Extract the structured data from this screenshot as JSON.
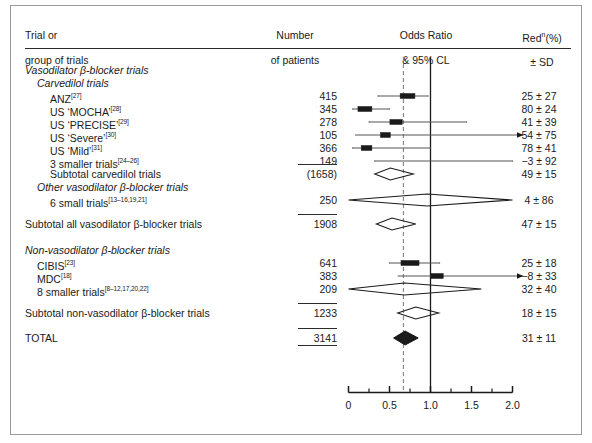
{
  "header": {
    "col_trial_line1": "Trial or",
    "col_trial_line2": "group of trials",
    "col_number_line1": "Number",
    "col_number_line2": "of patients",
    "col_or_line1": "Odds Ratio",
    "col_or_line2": "& 95% CL",
    "col_red_line1": "Red",
    "col_red_sup": "n",
    "col_red_line1b": "(%)",
    "col_red_line2": "± SD"
  },
  "chart_data": {
    "type": "forest",
    "title": "Odds Ratio & 95% CL",
    "xlabel": "",
    "xlim": [
      0,
      2.0
    ],
    "xticks": [
      0,
      0.5,
      1.0,
      1.5,
      2.0
    ],
    "xticklabels": [
      "0",
      "0.5",
      "1.0",
      "1.5",
      "2.0"
    ],
    "minor_ticks": [
      0.25,
      0.75,
      1.25,
      1.75
    ],
    "reference_line": 1.0,
    "pooled_line": 0.67,
    "grid": false,
    "rows": [
      {
        "kind": "section",
        "indent": 0,
        "italic": true,
        "label": "Vasodilator β-blocker trials",
        "n": "",
        "red": ""
      },
      {
        "kind": "section",
        "indent": 1,
        "italic": true,
        "label": "Carvedilol trials",
        "n": "",
        "red": ""
      },
      {
        "kind": "trial",
        "indent": 2,
        "italic": false,
        "label": "ANZ",
        "ref": "[27]",
        "n": "415",
        "red": "25 ± 27",
        "or": 0.72,
        "ci_low": 0.36,
        "ci_high": 0.97,
        "box": 0.09,
        "arrow": false
      },
      {
        "kind": "trial",
        "indent": 2,
        "italic": false,
        "label": "US ‘MOCHA’",
        "ref": "[28]",
        "n": "345",
        "red": "80 ± 24",
        "or": 0.2,
        "ci_low": 0.05,
        "ci_high": 0.5,
        "box": 0.085,
        "arrow": false
      },
      {
        "kind": "trial",
        "indent": 2,
        "italic": false,
        "label": "US ‘PRECISE’",
        "ref": "[29]",
        "n": "278",
        "red": "41 ± 39",
        "or": 0.58,
        "ci_low": 0.25,
        "ci_high": 1.44,
        "box": 0.075,
        "arrow": false
      },
      {
        "kind": "trial",
        "indent": 2,
        "italic": false,
        "label": "US ‘Severe’",
        "ref": "[30]",
        "n": "105",
        "red": "54 ± 75",
        "or": 0.45,
        "ci_low": 0.08,
        "ci_high": 2.0,
        "box": 0.06,
        "arrow": true
      },
      {
        "kind": "trial",
        "indent": 2,
        "italic": false,
        "label": "US ‘Mild’",
        "ref": "[31]",
        "n": "366",
        "red": "78 ± 41",
        "or": 0.22,
        "ci_low": 0.05,
        "ci_high": 1.0,
        "box": 0.065,
        "arrow": false
      },
      {
        "kind": "trial",
        "indent": 2,
        "italic": false,
        "label": "3 smaller trials",
        "ref": "[24–26]",
        "n": "149",
        "red": "−3 ± 92",
        "or": 1.03,
        "ci_low": 0.32,
        "ci_high": 2.0,
        "box": 0.0,
        "arrow": false,
        "flat": true
      },
      {
        "kind": "subtotal",
        "indent": 2,
        "italic": false,
        "label": "Subtotal carvedilol trials",
        "n": "(1658)",
        "red": "49 ± 15",
        "or": 0.51,
        "ci_low": 0.32,
        "ci_high": 0.79,
        "diamond": true,
        "filled": false
      },
      {
        "kind": "section",
        "indent": 1,
        "italic": true,
        "label": "Other vasodilator β-blocker trials",
        "n": "",
        "red": ""
      },
      {
        "kind": "trial",
        "indent": 2,
        "italic": false,
        "label": "6 small trials",
        "ref": "[13–16,19,21]",
        "n": "250",
        "red": "4 ± 86",
        "or": 0.96,
        "ci_low": 0.0,
        "ci_high": 2.0,
        "diamond": true,
        "filled": false
      },
      {
        "kind": "subtotal-major",
        "indent": 0,
        "italic": false,
        "label": "Subtotal all vasodilator β-blocker trials",
        "n": "1908",
        "rule": true,
        "red": "47 ± 15",
        "or": 0.53,
        "ci_low": 0.34,
        "ci_high": 0.82,
        "diamond": true,
        "filled": false
      },
      {
        "kind": "section",
        "indent": 0,
        "italic": true,
        "label": "Non-vasodilator β-blocker trials",
        "n": "",
        "red": ""
      },
      {
        "kind": "trial",
        "indent": 1,
        "italic": false,
        "label": "CIBIS",
        "ref": "[23]",
        "n": "641",
        "red": "25 ± 18",
        "or": 0.75,
        "ci_low": 0.5,
        "ci_high": 1.11,
        "box": 0.11,
        "arrow": false
      },
      {
        "kind": "trial",
        "indent": 1,
        "italic": false,
        "label": "MDC",
        "ref": "[18]",
        "n": "383",
        "red": "−8 ± 33",
        "or": 1.08,
        "ci_low": 0.6,
        "ci_high": 2.0,
        "box": 0.075,
        "arrow": true
      },
      {
        "kind": "trial",
        "indent": 1,
        "italic": false,
        "label": "8 smaller trials",
        "ref": "[8–12,17,20,22]",
        "n": "209",
        "red": "32 ± 40",
        "or": 0.68,
        "ci_low": 0.0,
        "ci_high": 1.62,
        "diamond": true,
        "filled": false
      },
      {
        "kind": "subtotal-major",
        "indent": 0,
        "italic": false,
        "label": "Subtotal non-vasodilator β-blocker trials",
        "n": "1233",
        "rule": true,
        "red": "18 ± 15",
        "or": 0.82,
        "ci_low": 0.6,
        "ci_high": 1.1,
        "diamond": true,
        "filled": false
      },
      {
        "kind": "total",
        "indent": 0,
        "italic": false,
        "label": "TOTAL",
        "n": "3141",
        "red": "31 ± 11",
        "or": 0.69,
        "ci_low": 0.55,
        "ci_high": 0.85,
        "diamond": true,
        "filled": true
      }
    ]
  },
  "colors": {
    "ink": "#1a1a1a",
    "rule": "#2b2b2b",
    "ci_line": "#555555",
    "frame": "#9a9a9a",
    "dashed": "#8a8a8a"
  }
}
